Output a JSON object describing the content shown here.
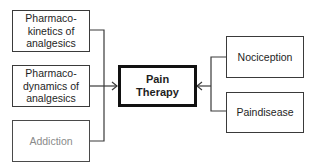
{
  "diagram": {
    "center": {
      "label": "Pain\nTherapy"
    },
    "left_nodes": [
      {
        "label": "Pharmaco-\nkinetics of\nanalgesics",
        "style": "normal"
      },
      {
        "label": "Pharmaco-\ndynamics of\nanalgesics",
        "style": "normal"
      },
      {
        "label": "Addiction",
        "style": "gray"
      }
    ],
    "right_nodes": [
      {
        "label": "Nociception"
      },
      {
        "label": "Paindisease"
      }
    ],
    "colors": {
      "line": "#3a3a3a",
      "center_border": "#111111",
      "gray_text": "#8a8a8a"
    }
  }
}
